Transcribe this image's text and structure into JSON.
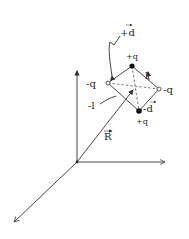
{
  "diagram": {
    "type": "physics-vector-diagram",
    "axes": {
      "origin": [
        77,
        162
      ],
      "z_end": [
        77,
        70
      ],
      "x_end": [
        165,
        162
      ],
      "y_end": [
        14,
        222
      ]
    },
    "vertices": {
      "top": {
        "pos": [
          132,
          66
        ],
        "charge": "+q",
        "filled": true
      },
      "left": {
        "pos": [
          108,
          83
        ],
        "charge": "-q",
        "filled": false
      },
      "right": {
        "pos": [
          159,
          89
        ],
        "charge": "-q",
        "filled": false
      },
      "bottom": {
        "pos": [
          139,
          111
        ],
        "charge": "+q",
        "filled": true
      }
    },
    "center": [
      134,
      88
    ],
    "labels": {
      "plus_d": "+d",
      "minus_d": "-d",
      "l": "l",
      "minus_l": "-l",
      "R": "R",
      "q_top": "+q",
      "q_left": "-q",
      "q_right": "-q",
      "q_bottom": "+q"
    }
  }
}
